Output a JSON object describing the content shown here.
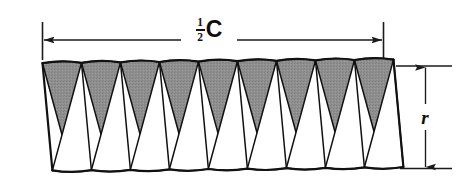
{
  "figure": {
    "canvas": {
      "width": 458,
      "height": 191,
      "background": "#ffffff"
    },
    "colors": {
      "shaded_wedge_fill": "#8d8d8d",
      "unshaded_wedge_fill": "#ffffff",
      "outline": "#111111",
      "dimension_line": "#1a1a1a",
      "label_text": "#0d0d0d"
    },
    "wedges": {
      "total_count": 18,
      "shaded_count": 9,
      "unshaded_count": 9,
      "arrangement": "alternating shaded-down and unshaded-up sectors",
      "shaded_orientation": "apex-down",
      "unshaded_orientation": "apex-up",
      "top_edge": "scalloped arcs bulging upward",
      "bottom_edge": "scalloped arcs bulging downward"
    },
    "dimensions": {
      "width_label": {
        "name": "half-circumference",
        "numerator": "1",
        "denominator": "2",
        "symbol": "C",
        "text": "1/2 C",
        "arrow_style": "double-headed horizontal",
        "from_x": 42,
        "to_x": 383,
        "y": 40
      },
      "height_label": {
        "name": "radius",
        "symbol": "r",
        "text": "r",
        "arrow_style": "double-headed vertical",
        "x": 425,
        "from_y": 66,
        "to_y": 168
      }
    }
  }
}
